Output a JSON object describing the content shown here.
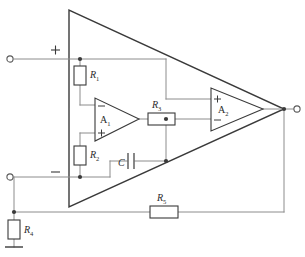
{
  "figure": {
    "background_color": "#ffffff",
    "wire_color": "#8c8c8c",
    "body_color": "#3a3a3a",
    "label_color": "#2b2b2b"
  },
  "components": {
    "r1": {
      "name": "R1",
      "label_main": "R",
      "label_sub": "1",
      "orientation": "vertical"
    },
    "r2": {
      "name": "R2",
      "label_main": "R",
      "label_sub": "2",
      "orientation": "vertical"
    },
    "r3": {
      "name": "R3",
      "label_main": "R",
      "label_sub": "3",
      "orientation": "horizontal"
    },
    "r4": {
      "name": "R4",
      "label_main": "R",
      "label_sub": "4",
      "orientation": "vertical"
    },
    "r5": {
      "name": "R5",
      "label_main": "R",
      "label_sub": "5",
      "orientation": "horizontal"
    },
    "c1": {
      "name": "C",
      "label_main": "C",
      "label_sub": "",
      "orientation": "horizontal"
    },
    "a1": {
      "name": "A1",
      "label_main": "A",
      "label_sub": "1",
      "input_top": "−",
      "input_bottom": "+"
    },
    "a2": {
      "name": "A2",
      "label_main": "A",
      "label_sub": "2",
      "input_top": "+",
      "input_bottom": "−"
    }
  },
  "terminals": {
    "input_plus": {
      "sign": "+",
      "type": "open-circle-terminal"
    },
    "input_minus": {
      "sign": "−",
      "type": "open-circle-terminal"
    },
    "output": {
      "sign": "",
      "type": "open-circle-terminal"
    },
    "ground": {
      "name": "ground",
      "type": "ground-symbol"
    }
  }
}
